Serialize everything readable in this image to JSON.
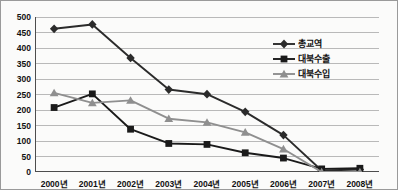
{
  "chart_data": {
    "type": "line",
    "title": "",
    "xlabel": "",
    "ylabel": "",
    "x": [
      "2000년",
      "2001년",
      "2002년",
      "2003년",
      "2004년",
      "2005년",
      "2006년",
      "2007년",
      "2008년"
    ],
    "categories": [
      "2000년",
      "2001년",
      "2002년",
      "2003년",
      "2004년",
      "2005년",
      "2006년",
      "2007년",
      "2008년"
    ],
    "yticks": [
      0,
      50,
      100,
      150,
      200,
      250,
      300,
      350,
      400,
      450,
      500
    ],
    "ylim": [
      0,
      500
    ],
    "grid": true,
    "legend_position": "right-upper-inside",
    "series": [
      {
        "name": "총교역",
        "marker": "diamond",
        "color": "#2b2b2b",
        "values": [
          462,
          476,
          368,
          266,
          251,
          194,
          119,
          5,
          8
        ]
      },
      {
        "name": "대북수출",
        "marker": "square",
        "color": "#1a1a1a",
        "values": [
          208,
          252,
          138,
          92,
          89,
          62,
          45,
          10,
          12
        ]
      },
      {
        "name": "대북수입",
        "marker": "triangle",
        "color": "#8f8f8f",
        "values": [
          255,
          223,
          231,
          172,
          160,
          128,
          74,
          0,
          0
        ]
      }
    ]
  },
  "colors": {
    "grid": "#b9b9b9",
    "axis": "#4d4d4d",
    "background": "#fbfbfa",
    "border": "#9a9a9a",
    "series_total": "#2b2b2b",
    "series_export": "#1a1a1a",
    "series_import": "#8f8f8f"
  }
}
